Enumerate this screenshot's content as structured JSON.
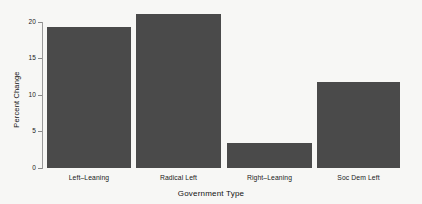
{
  "chart_data": {
    "type": "bar",
    "title": "",
    "subtitle": "",
    "xlabel": "Government Type",
    "ylabel": "Percent Change",
    "categories": [
      "Left–Leaning",
      "Radical Left",
      "Right–Leaning",
      "Soc Dem Left"
    ],
    "values": [
      19.5,
      21.2,
      3.4,
      11.8
    ],
    "ylim": [
      0,
      21.8
    ],
    "yticks": [
      0,
      5,
      10,
      15,
      20
    ],
    "ytick_labels": [
      "0",
      "5",
      "10",
      "15",
      "20"
    ],
    "grid": false,
    "legend": null,
    "bar_color": "#4a4a4a",
    "background_color": "#f7f7f5",
    "axis_color": "#9a9a9a",
    "text_color": "#1a1a1a"
  },
  "axes": {
    "y_title": "Percent Change",
    "x_title": "Government Type",
    "y_ticks": [
      {
        "label": "20",
        "value": 20
      },
      {
        "label": "15",
        "value": 15
      },
      {
        "label": "10",
        "value": 10
      },
      {
        "label": "5",
        "value": 5
      },
      {
        "label": "0",
        "value": 0
      }
    ]
  },
  "bars": [
    {
      "label": "Left–Leaning",
      "value": 19.5
    },
    {
      "label": "Radical Left",
      "value": 21.2
    },
    {
      "label": "Right–Leaning",
      "value": 3.4
    },
    {
      "label": "Soc Dem Left",
      "value": 11.8
    }
  ]
}
